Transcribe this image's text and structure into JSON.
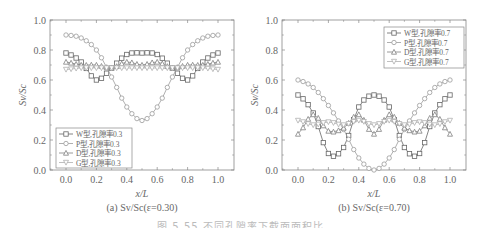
{
  "figure_caption": "图 5.55 不同孔隙率下截面面积比",
  "chart_data": [
    {
      "type": "line",
      "panel": "a",
      "title": "(a) Sv/Sc(ε=0.30)",
      "xlabel": "x/L",
      "ylabel": "Sv/Sc",
      "xlim": [
        -0.1,
        1.05
      ],
      "ylim": [
        0.0,
        1.0
      ],
      "xticks": [
        "0.0",
        "0.2",
        "0.4",
        "0.6",
        "0.8",
        "1.0"
      ],
      "yticks": [
        "0.0",
        "0.2",
        "0.4",
        "0.6",
        "0.8",
        "1.0"
      ],
      "grid": false,
      "legend_position": "lower-left",
      "x": [
        0.0,
        0.1,
        0.2,
        0.3,
        0.4,
        0.5,
        0.6,
        0.7,
        0.8,
        0.9,
        1.0
      ],
      "series": [
        {
          "name": "W型,孔隙率0.3",
          "marker": "square",
          "values": [
            0.78,
            0.72,
            0.6,
            0.68,
            0.77,
            0.78,
            0.77,
            0.68,
            0.6,
            0.72,
            0.78
          ]
        },
        {
          "name": "P型,孔隙率0.3",
          "marker": "circle",
          "values": [
            0.9,
            0.88,
            0.8,
            0.62,
            0.42,
            0.33,
            0.42,
            0.62,
            0.8,
            0.88,
            0.9
          ]
        },
        {
          "name": "D型,孔隙率0.3",
          "marker": "triangle-up",
          "values": [
            0.72,
            0.7,
            0.7,
            0.68,
            0.72,
            0.7,
            0.72,
            0.68,
            0.7,
            0.7,
            0.72
          ]
        },
        {
          "name": "G型,孔隙率0.3",
          "marker": "triangle-down",
          "values": [
            0.67,
            0.68,
            0.68,
            0.68,
            0.68,
            0.68,
            0.68,
            0.68,
            0.68,
            0.68,
            0.67
          ]
        }
      ]
    },
    {
      "type": "line",
      "panel": "b",
      "title": "(b) Sv/Sc(ε=0.70)",
      "xlabel": "x/L",
      "ylabel": "Sv/Sc",
      "xlim": [
        -0.1,
        1.05
      ],
      "ylim": [
        0.0,
        1.0
      ],
      "xticks": [
        "0.0",
        "0.2",
        "0.4",
        "0.6",
        "0.8",
        "1.0"
      ],
      "yticks": [
        "0.0",
        "0.2",
        "0.4",
        "0.6",
        "0.8",
        "1.0"
      ],
      "grid": false,
      "legend_position": "upper-right",
      "x": [
        0.0,
        0.1,
        0.2,
        0.3,
        0.4,
        0.5,
        0.6,
        0.7,
        0.8,
        0.9,
        1.0
      ],
      "series": [
        {
          "name": "W型,孔隙率0.7",
          "marker": "square",
          "values": [
            0.5,
            0.38,
            0.11,
            0.15,
            0.42,
            0.5,
            0.42,
            0.15,
            0.11,
            0.38,
            0.5
          ]
        },
        {
          "name": "P型,孔隙率0.7",
          "marker": "circle",
          "values": [
            0.6,
            0.55,
            0.43,
            0.27,
            0.08,
            0.0,
            0.08,
            0.27,
            0.43,
            0.55,
            0.6
          ]
        },
        {
          "name": "D型,孔隙率0.7",
          "marker": "triangle-up",
          "values": [
            0.24,
            0.37,
            0.26,
            0.28,
            0.37,
            0.24,
            0.37,
            0.28,
            0.26,
            0.37,
            0.24
          ]
        },
        {
          "name": "G型,孔隙率0.7",
          "marker": "triangle-down",
          "values": [
            0.33,
            0.3,
            0.32,
            0.3,
            0.33,
            0.3,
            0.33,
            0.3,
            0.32,
            0.3,
            0.33
          ]
        }
      ]
    }
  ],
  "colors": {
    "axis": "#888888",
    "series_W": "#666666",
    "series_P": "#9a9a9a",
    "series_D": "#808080",
    "series_G": "#b0b0b0"
  }
}
